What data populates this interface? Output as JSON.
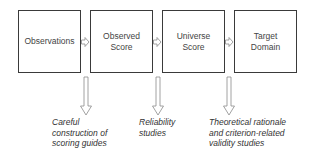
{
  "diagram": {
    "boxes": [
      {
        "label": "Observations"
      },
      {
        "label": "Observed\nScore"
      },
      {
        "label": "Universe\nScore"
      },
      {
        "label": "Target\nDomain"
      }
    ],
    "notes": [
      {
        "text": "Careful construction of scoring guides"
      },
      {
        "text": "Reliability studies"
      },
      {
        "text": "Theoretical rationale and criterion-related validity studies"
      }
    ],
    "colors": {
      "box_border": "#3a3a3a",
      "arrow_stroke": "#8a8a8a"
    }
  }
}
